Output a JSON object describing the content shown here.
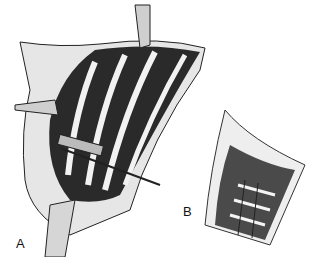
{
  "figure": {
    "panels": [
      {
        "id": "A",
        "label": "A",
        "description": "Surgical exposure of chest wall with rib strips, retractors and instrument"
      },
      {
        "id": "B",
        "label": "B",
        "description": "Inset view of incision with mesh-like grid repair"
      }
    ],
    "colors": {
      "background": "#ffffff",
      "ink": "#111111",
      "muscle": "#2a2a2a",
      "rib": "#f2f2f2",
      "skin": "#d8d8d8"
    }
  }
}
